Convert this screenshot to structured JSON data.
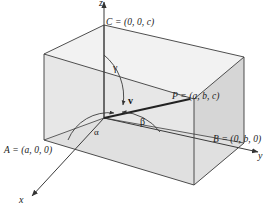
{
  "figure": {
    "type": "3d-box-direction-angles-diagram",
    "background_color": "#ffffff",
    "line_color": "#3a3a3a",
    "face_fill_light": "#efefef",
    "face_fill_mid": "#e4e4e4",
    "face_fill_dark": "#d6d6d6",
    "axes": {
      "x_label": "x",
      "y_label": "y",
      "z_label": "z"
    },
    "points": {
      "C": "C = (0, 0, c)",
      "P": "P = (a, b, c)",
      "B": "B = (0, b, 0)",
      "A": "A = (a, 0, 0)"
    },
    "angles": {
      "alpha": "α",
      "beta": "β",
      "gamma": "γ"
    },
    "vector": {
      "label": "v"
    }
  }
}
